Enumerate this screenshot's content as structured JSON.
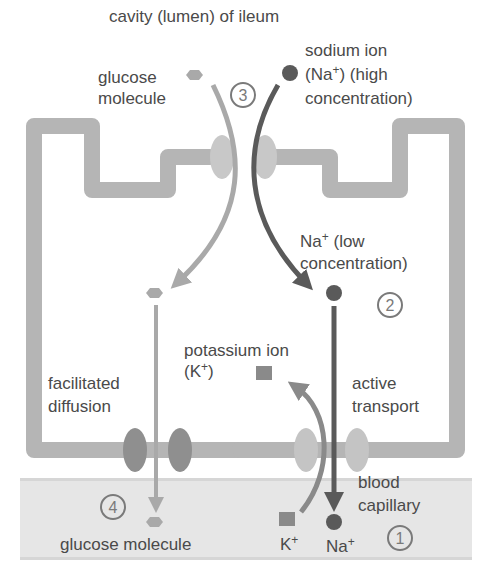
{
  "title": "cavity (lumen) of ileum",
  "labels": {
    "glucose_top": [
      "glucose",
      "molecule"
    ],
    "sodium_top": [
      "sodium ion",
      "(Na",
      "+",
      ") (high",
      "concentration)"
    ],
    "na_low": [
      "Na",
      "+",
      " (low",
      "concentration)"
    ],
    "potassium": [
      "potassium ion",
      "(K",
      "+",
      ")"
    ],
    "facilitated": [
      "facilitated",
      "diffusion"
    ],
    "active": [
      "active",
      "transport"
    ],
    "blood": [
      "blood",
      "capillary"
    ],
    "glucose_bottom": "glucose molecule",
    "k_bottom": [
      "K",
      "+"
    ],
    "na_bottom": [
      "Na",
      "+"
    ]
  },
  "steps": {
    "step1": "1",
    "step2": "2",
    "step3": "3",
    "step4": "4"
  },
  "colors": {
    "membrane": "#b5b5b5",
    "blood_band": "#e6e6e6",
    "glucose": "#a9a9a9",
    "sodium": "#5a5a5a",
    "potassium": "#8a8a8a",
    "carrier_light": "#c4c4c4",
    "carrier_dark": "#8f8f8f",
    "text": "#4a4a4a"
  }
}
